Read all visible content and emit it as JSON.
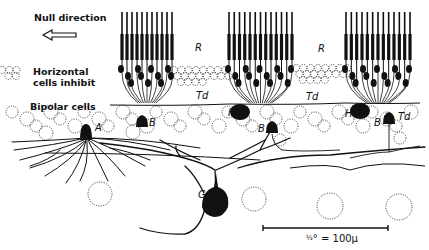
{
  "labels": {
    "null_direction": "Null direction",
    "horizontal_line1": "Horizontal",
    "horizontal_line2": "cells inhibit",
    "bipolar": "Bipolar cells",
    "R1": "R",
    "R2": "R",
    "Td1": "Td",
    "Td2": "Td",
    "Td3": "Td",
    "A": "A",
    "B1": "B",
    "B2": "B",
    "B3": "B",
    "H1": "H",
    "H2": "H",
    "G": "G"
  },
  "scale_bar": {
    "fraction": "½",
    "text": "° = 100μ",
    "x1": 263,
    "x2": 388,
    "y": 228
  },
  "colors": {
    "ink": "#111111",
    "background": "#ffffff"
  },
  "receptor_groups": [
    {
      "x_start": 122,
      "x_end": 172,
      "count": 11
    },
    {
      "x_start": 229,
      "x_end": 292,
      "count": 13
    },
    {
      "x_start": 346,
      "x_end": 410,
      "count": 13
    }
  ],
  "somata": [
    {
      "id": "A",
      "type": "amacrine",
      "x": 86,
      "y": 132
    },
    {
      "id": "B1",
      "type": "bipolar",
      "x": 142,
      "y": 122
    },
    {
      "id": "H1",
      "type": "horizontal",
      "x": 240,
      "y": 112
    },
    {
      "id": "B2",
      "type": "bipolar",
      "x": 272,
      "y": 128
    },
    {
      "id": "H2",
      "type": "horizontal",
      "x": 360,
      "y": 111
    },
    {
      "id": "B3",
      "type": "bipolar",
      "x": 389,
      "y": 119
    },
    {
      "id": "G",
      "type": "ganglion",
      "x": 216,
      "y": 203
    }
  ]
}
